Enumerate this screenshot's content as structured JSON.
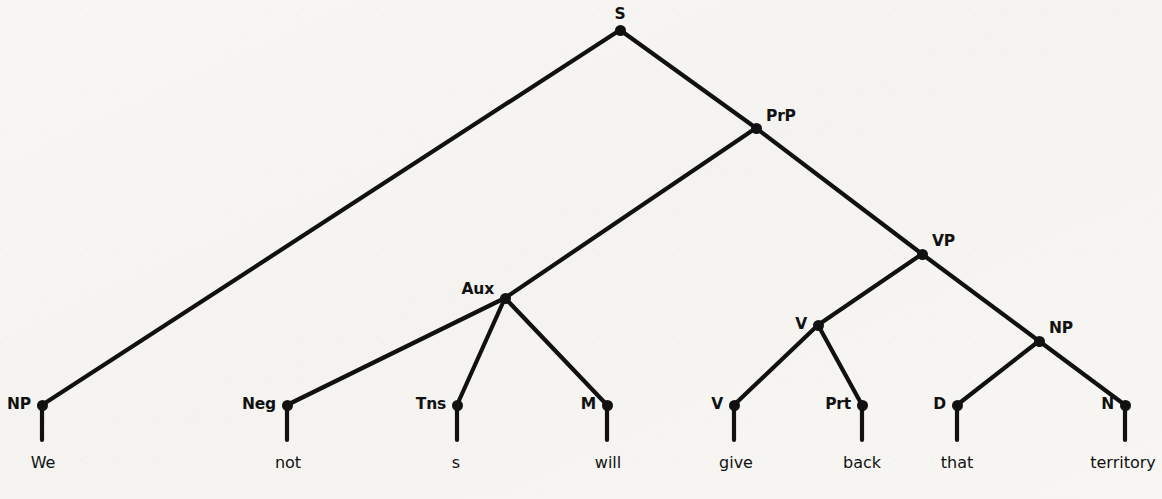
{
  "figure": {
    "kind": "syntax-tree",
    "sentence": "We will not give back that territory",
    "background_color": "#f6f5f2",
    "ink_color": "#111111",
    "width": 1162,
    "height": 499
  },
  "nodes": [
    {
      "id": "S",
      "label": "S",
      "x": 620,
      "y": 30,
      "label_x": 620,
      "label_y": 22,
      "label_pos": "pos-above"
    },
    {
      "id": "NP1",
      "label": "NP",
      "x": 42,
      "y": 405,
      "label_x": 31,
      "label_y": 405,
      "label_pos": "pos-left"
    },
    {
      "id": "PrP",
      "label": "PrP",
      "x": 756,
      "y": 128,
      "label_x": 766,
      "label_y": 124,
      "label_pos": "pos-upper-right"
    },
    {
      "id": "Aux",
      "label": "Aux",
      "x": 505,
      "y": 298,
      "label_x": 494,
      "label_y": 290,
      "label_pos": "pos-left"
    },
    {
      "id": "VP",
      "label": "VP",
      "x": 922,
      "y": 254,
      "label_x": 932,
      "label_y": 249,
      "label_pos": "pos-upper-right"
    },
    {
      "id": "Neg",
      "label": "Neg",
      "x": 287,
      "y": 405,
      "label_x": 276,
      "label_y": 405,
      "label_pos": "pos-left"
    },
    {
      "id": "Tns",
      "label": "Tns",
      "x": 457,
      "y": 405,
      "label_x": 446,
      "label_y": 405,
      "label_pos": "pos-left"
    },
    {
      "id": "M",
      "label": "M",
      "x": 607,
      "y": 405,
      "label_x": 596,
      "label_y": 405,
      "label_pos": "pos-left"
    },
    {
      "id": "Vbar",
      "label": "V",
      "x": 818,
      "y": 325,
      "label_x": 807,
      "label_y": 325,
      "label_pos": "pos-left"
    },
    {
      "id": "NP2",
      "label": "NP",
      "x": 1039,
      "y": 341,
      "label_x": 1049,
      "label_y": 336,
      "label_pos": "pos-upper-right"
    },
    {
      "id": "V",
      "label": "V",
      "x": 734,
      "y": 405,
      "label_x": 723,
      "label_y": 405,
      "label_pos": "pos-left"
    },
    {
      "id": "Prt",
      "label": "Prt",
      "x": 862,
      "y": 405,
      "label_x": 851,
      "label_y": 405,
      "label_pos": "pos-left"
    },
    {
      "id": "D",
      "label": "D",
      "x": 957,
      "y": 405,
      "label_x": 946,
      "label_y": 405,
      "label_pos": "pos-left"
    },
    {
      "id": "N",
      "label": "N",
      "x": 1125,
      "y": 405,
      "label_x": 1114,
      "label_y": 405,
      "label_pos": "pos-left"
    }
  ],
  "edges": [
    {
      "from": "S",
      "to": "NP1"
    },
    {
      "from": "S",
      "to": "PrP"
    },
    {
      "from": "PrP",
      "to": "Aux"
    },
    {
      "from": "PrP",
      "to": "VP"
    },
    {
      "from": "Aux",
      "to": "Neg"
    },
    {
      "from": "Aux",
      "to": "Tns"
    },
    {
      "from": "Aux",
      "to": "M"
    },
    {
      "from": "VP",
      "to": "Vbar"
    },
    {
      "from": "VP",
      "to": "NP2"
    },
    {
      "from": "Vbar",
      "to": "V"
    },
    {
      "from": "Vbar",
      "to": "Prt"
    },
    {
      "from": "NP2",
      "to": "D"
    },
    {
      "from": "NP2",
      "to": "N"
    }
  ],
  "words": [
    {
      "parent": "NP1",
      "text": "We",
      "x": 43,
      "y": 455,
      "stem_to_y": 440
    },
    {
      "parent": "Neg",
      "text": "not",
      "x": 288,
      "y": 455,
      "stem_to_y": 440
    },
    {
      "parent": "Tns",
      "text": "s",
      "x": 456,
      "y": 455,
      "stem_to_y": 440
    },
    {
      "parent": "M",
      "text": "will",
      "x": 608,
      "y": 455,
      "stem_to_y": 440
    },
    {
      "parent": "V",
      "text": "give",
      "x": 736,
      "y": 455,
      "stem_to_y": 440
    },
    {
      "parent": "Prt",
      "text": "back",
      "x": 862,
      "y": 455,
      "stem_to_y": 440
    },
    {
      "parent": "D",
      "text": "that",
      "x": 957,
      "y": 455,
      "stem_to_y": 440
    },
    {
      "parent": "N",
      "text": "territory",
      "x": 1123,
      "y": 455,
      "stem_to_y": 440
    }
  ]
}
